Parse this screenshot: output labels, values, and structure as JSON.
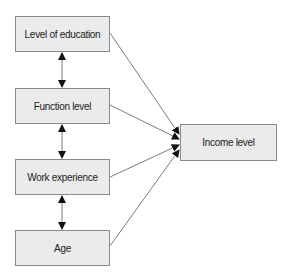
{
  "diagram": {
    "type": "flow",
    "colors": {
      "box_fill": "#ebebeb",
      "box_border": "#8a8a8a",
      "line": "#7a7a7a",
      "arrow_head": "#111111",
      "text": "#222222"
    },
    "nodes": [
      {
        "id": "education",
        "label": "Level of education",
        "x": 15,
        "y": 16,
        "w": 95,
        "h": 36
      },
      {
        "id": "function",
        "label": "Function level",
        "x": 15,
        "y": 88,
        "w": 95,
        "h": 36
      },
      {
        "id": "experience",
        "label": "Work experience",
        "x": 15,
        "y": 159,
        "w": 95,
        "h": 36
      },
      {
        "id": "age",
        "label": "Age",
        "x": 15,
        "y": 230,
        "w": 95,
        "h": 36
      },
      {
        "id": "income",
        "label": "Income level",
        "x": 180,
        "y": 124,
        "w": 97,
        "h": 37
      }
    ],
    "edges": [
      {
        "from": "education",
        "to": "function",
        "kind": "bidirectional"
      },
      {
        "from": "function",
        "to": "experience",
        "kind": "bidirectional"
      },
      {
        "from": "experience",
        "to": "age",
        "kind": "bidirectional"
      },
      {
        "from": "education",
        "to": "income",
        "kind": "directed"
      },
      {
        "from": "function",
        "to": "income",
        "kind": "directed"
      },
      {
        "from": "experience",
        "to": "income",
        "kind": "directed"
      },
      {
        "from": "age",
        "to": "income",
        "kind": "directed"
      }
    ]
  }
}
